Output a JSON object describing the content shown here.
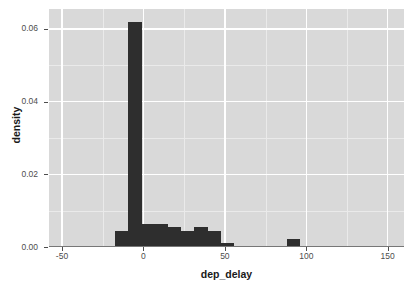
{
  "chart_data": {
    "type": "bar",
    "chart_subtype": "histogram",
    "title": "",
    "subtitle": "",
    "xlabel": "dep_delay",
    "ylabel": "density",
    "xlim": [
      -58,
      160
    ],
    "ylim": [
      0,
      0.0655
    ],
    "xticks": [
      -50,
      0,
      50,
      100,
      150
    ],
    "xtick_labels": [
      "-50",
      "0",
      "50",
      "100",
      "150"
    ],
    "yticks": [
      0.0,
      0.02,
      0.04,
      0.06
    ],
    "ytick_labels": [
      "0.00",
      "0.02",
      "0.04",
      "0.06"
    ],
    "grid": true,
    "legend": null,
    "bin_width": 8.1,
    "bars": [
      {
        "bin_start": -17.3,
        "bin_end": -9.2,
        "value": 0.0043
      },
      {
        "bin_start": -9.2,
        "bin_end": -1.1,
        "value": 0.0619
      },
      {
        "bin_start": -1.1,
        "bin_end": 7.0,
        "value": 0.0064
      },
      {
        "bin_start": 7.0,
        "bin_end": 15.1,
        "value": 0.0064
      },
      {
        "bin_start": 15.1,
        "bin_end": 23.2,
        "value": 0.0054
      },
      {
        "bin_start": 23.2,
        "bin_end": 31.3,
        "value": 0.0043
      },
      {
        "bin_start": 31.3,
        "bin_end": 39.4,
        "value": 0.0054
      },
      {
        "bin_start": 39.4,
        "bin_end": 47.5,
        "value": 0.0043
      },
      {
        "bin_start": 47.5,
        "bin_end": 55.6,
        "value": 0.0011
      },
      {
        "bin_start": 63.7,
        "bin_end": 71.8,
        "value": 0.0
      },
      {
        "bin_start": 88.0,
        "bin_end": 96.1,
        "value": 0.0021
      }
    ],
    "bar_color": "#2e2e2e",
    "panel_background": "#d9d9d9",
    "gridline_color": "#ffffff",
    "figure_background": "#ffffff"
  }
}
